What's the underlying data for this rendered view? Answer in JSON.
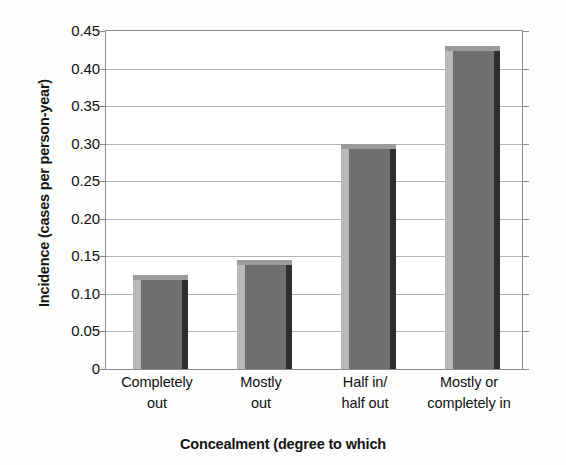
{
  "chart_data": {
    "type": "bar",
    "title": "",
    "categories": [
      "Completely out",
      "Mostly out",
      "Half in/ half out",
      "Mostly or completely in"
    ],
    "category_lines": [
      [
        "Completely",
        "out"
      ],
      [
        "Mostly",
        "out"
      ],
      [
        "Half in/",
        "half out"
      ],
      [
        "Mostly or",
        "completely in"
      ]
    ],
    "values": [
      0.125,
      0.145,
      0.3,
      0.43
    ],
    "xlabel": "Concealment (degree to which",
    "ylabel": "Incidence (cases per person-year)",
    "ylim": [
      0,
      0.45
    ],
    "ytick_values": [
      0,
      0.05,
      0.1,
      0.15,
      0.2,
      0.25,
      0.3,
      0.35,
      0.4,
      0.45
    ],
    "ytick_labels": [
      "0",
      "0.05",
      "0.10",
      "0.15",
      "0.20",
      "0.25",
      "0.30",
      "0.35",
      "0.40",
      "0.45"
    ],
    "grid": true,
    "legend": false,
    "bar_color_front": "#6f6f6f",
    "bar_color_left": "#b9b9b9",
    "bar_color_top": "#9b9b9b",
    "bar_color_right": "#2e2e2e",
    "gridline_color": "#b4b4b4",
    "axis_color": "#8c8c8c"
  }
}
